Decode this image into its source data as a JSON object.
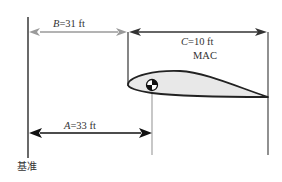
{
  "diagram": {
    "type": "mean-aerodynamic-chord-cg-location",
    "dimensions": {
      "B": {
        "var": "B",
        "text": "=31 ft",
        "color": "#9a9a9a"
      },
      "C": {
        "var": "C",
        "text": "=10 ft",
        "color": "#333333"
      },
      "A": {
        "var": "A",
        "text": "=33 ft",
        "color": "#222222"
      }
    },
    "mac_label": "MAC",
    "datum_label": "基准",
    "colors": {
      "line_dark": "#444444",
      "line_gray": "#aaaaaa",
      "airfoil_fill": "#e8e8e8",
      "airfoil_stroke": "#222222"
    }
  }
}
